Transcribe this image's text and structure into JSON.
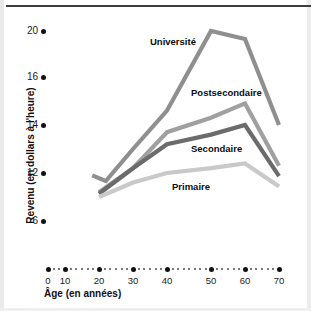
{
  "chart_data": {
    "type": "line",
    "title": "",
    "xlabel": "Âge (en années)",
    "ylabel": "Revenu (en dollars à l'heure)",
    "x": [
      20,
      30,
      40,
      50,
      60,
      70
    ],
    "xlim": [
      0,
      70
    ],
    "ylim": [
      6,
      20
    ],
    "x_ticks": [
      0,
      10,
      20,
      30,
      40,
      50,
      60,
      70
    ],
    "x_tick_labels": [
      "0",
      "10",
      "20",
      "30",
      "40",
      "50",
      "60",
      "70"
    ],
    "y_ticks": [
      6,
      12,
      14,
      16,
      20
    ],
    "y_tick_labels": [
      "6",
      "12",
      "14",
      "16",
      "20"
    ],
    "grid": false,
    "legend_position": "inline-labels",
    "series": [
      {
        "name": "Université",
        "color": "#8f8f8f",
        "x": [
          18,
          22,
          30,
          40,
          50,
          60,
          70
        ],
        "values": [
          11.7,
          11.0,
          13.0,
          14.6,
          20.0,
          19.3,
          14.0
        ]
      },
      {
        "name": "Postsecondaire",
        "color": "#a0a0a0",
        "x": [
          20,
          30,
          40,
          50,
          60,
          70
        ],
        "values": [
          9.6,
          12.2,
          13.7,
          14.3,
          14.9,
          12.3
        ]
      },
      {
        "name": "Secondaire",
        "color": "#6b6b6b",
        "x": [
          20,
          30,
          40,
          50,
          60,
          70
        ],
        "values": [
          9.4,
          12.2,
          13.2,
          13.6,
          14.0,
          11.6
        ]
      },
      {
        "name": "Primaire",
        "color": "#c9c9c9",
        "x": [
          20,
          30,
          40,
          50,
          60,
          70
        ],
        "values": [
          9.0,
          10.8,
          12.0,
          12.2,
          12.4,
          10.3
        ]
      }
    ],
    "annotations": [
      {
        "text": "Université",
        "x_px": 150,
        "y_px": 36
      },
      {
        "text": "Postsecondaire",
        "x_px": 191,
        "y_px": 87
      },
      {
        "text": "Secondaire",
        "x_px": 191,
        "y_px": 143
      },
      {
        "text": "Primaire",
        "x_px": 172,
        "y_px": 181
      }
    ]
  },
  "axis": {
    "y_label": "Revenu (en dollars à l'heure)",
    "x_label": "Âge (en années)",
    "y_ticks": [
      {
        "label": "20",
        "y_px": 31
      },
      {
        "label": "16",
        "y_px": 77
      },
      {
        "label": "14",
        "y_px": 125
      },
      {
        "label": "12",
        "y_px": 173
      },
      {
        "label": "6",
        "y_px": 221
      }
    ],
    "x_ticks": [
      {
        "label": "0",
        "x_px": 48
      },
      {
        "label": "10",
        "x_px": 65
      },
      {
        "label": "20",
        "x_px": 99
      },
      {
        "label": "30",
        "x_px": 133
      },
      {
        "label": "40",
        "x_px": 167
      },
      {
        "label": "50",
        "x_px": 211
      },
      {
        "label": "60",
        "x_px": 245
      },
      {
        "label": "70",
        "x_px": 279
      }
    ],
    "axis_dot_row_y_px": 269
  },
  "colors": {
    "universite": "#8f8f8f",
    "postsecondaire": "#a0a0a0",
    "secondaire": "#6b6b6b",
    "primaire": "#c9c9c9",
    "text": "#111111",
    "rule": "#3d3d3d",
    "background": "#ffffff"
  }
}
